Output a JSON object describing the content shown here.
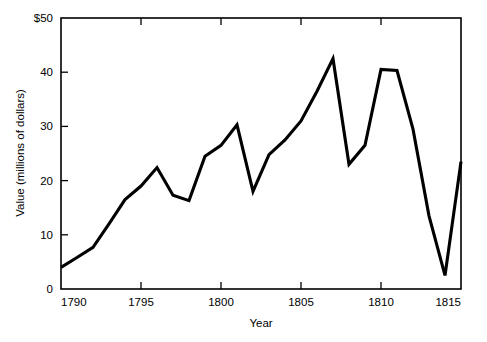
{
  "chart_data": {
    "type": "line",
    "title": "",
    "xlabel": "Year",
    "ylabel": "Value (millions of dollars)",
    "xlim": [
      1790,
      1815
    ],
    "ylim": [
      0,
      50
    ],
    "grid": false,
    "legend": null,
    "line_color": "#000000",
    "xticks": [
      1790,
      1795,
      1800,
      1805,
      1810,
      1815
    ],
    "xtick_labels": [
      "1790",
      "1795",
      "1800",
      "1805",
      "1810",
      "1815"
    ],
    "yticks": [
      0,
      10,
      20,
      30,
      40,
      50
    ],
    "ytick_labels": [
      "0",
      "10",
      "20",
      "30",
      "40",
      "$50"
    ],
    "x": [
      1790,
      1791,
      1792,
      1793,
      1794,
      1795,
      1796,
      1797,
      1798,
      1799,
      1800,
      1801,
      1802,
      1803,
      1804,
      1805,
      1806,
      1807,
      1808,
      1809,
      1810,
      1811,
      1812,
      1813,
      1814,
      1815
    ],
    "series": [
      {
        "name": "Value",
        "values": [
          4.0,
          5.8,
          7.7,
          12.0,
          16.5,
          19.0,
          22.4,
          17.3,
          16.3,
          24.5,
          26.5,
          30.3,
          18.0,
          24.8,
          27.5,
          31.0,
          36.5,
          42.5,
          23.0,
          26.5,
          40.5,
          40.3,
          29.5,
          13.5,
          2.5,
          23.5
        ]
      }
    ]
  }
}
